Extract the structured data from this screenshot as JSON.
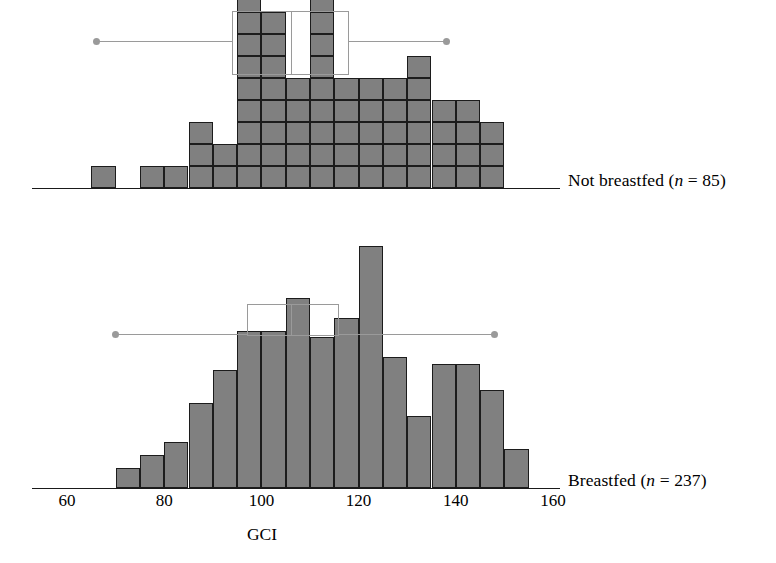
{
  "figure": {
    "axis_title": "GCI",
    "x_ticks": [
      {
        "value": 60,
        "label": "60"
      },
      {
        "value": 80,
        "label": "80"
      },
      {
        "value": 100,
        "label": "100"
      },
      {
        "value": 120,
        "label": "120"
      },
      {
        "value": 140,
        "label": "140"
      },
      {
        "value": 160,
        "label": "160"
      }
    ],
    "x_axis_range": [
      52,
      168
    ],
    "colors": {
      "bar_fill": "#808080",
      "bar_stroke": "#1c1c1c",
      "axis": "#1a1a1a",
      "boxplot": "#9a9a9a",
      "background": "#ffffff"
    }
  },
  "panels": [
    {
      "id": "not-breastfed",
      "label_text": "Not breastfed (",
      "label_n_symbol": "n",
      "label_equals": " = ",
      "label_n_value": "85)",
      "group": "Not breastfed",
      "n": 85,
      "chart_data": {
        "type": "bar",
        "title": "Not breastfed (n = 85)",
        "xlabel": "GCI",
        "ylabel": "Count",
        "bin_width": 5,
        "note": "Stacked-unit (dot) histogram; each square cell = 1 child. Tallest columns are clipped by the top edge of the image.",
        "categories": [
          67.5,
          72.5,
          77.5,
          82.5,
          87.5,
          92.5,
          97.5,
          102.5,
          107.5,
          112.5,
          117.5,
          122.5,
          127.5,
          132.5,
          137.5,
          142.5,
          147.5
        ],
        "bin_starts": [
          65,
          70,
          75,
          80,
          85,
          90,
          95,
          100,
          105,
          110,
          115,
          120,
          125,
          130,
          135,
          140,
          145
        ],
        "values": [
          1,
          0,
          1,
          1,
          3,
          2,
          9,
          8,
          5,
          9,
          5,
          5,
          5,
          6,
          4,
          4,
          3
        ],
        "xlim": [
          52,
          168
        ],
        "grid": false,
        "legend": "none"
      },
      "boxplot": {
        "min": 66,
        "q1": 94,
        "median": 106,
        "q3": 118,
        "max": 138,
        "whisker_style": "round-dot-caps"
      }
    },
    {
      "id": "breastfed",
      "label_text": "Breastfed (",
      "label_n_symbol": "n",
      "label_equals": " = ",
      "label_n_value": "237)",
      "group": "Breastfed",
      "n": 237,
      "chart_data": {
        "type": "bar",
        "title": "Breastfed (n = 237)",
        "xlabel": "GCI",
        "ylabel": "Count",
        "bin_width": 5,
        "note": "Frequency histogram, bin width 5 GCI points. Counts estimated from bar heights.",
        "categories": [
          72.5,
          77.5,
          82.5,
          87.5,
          92.5,
          97.5,
          102.5,
          107.5,
          112.5,
          117.5,
          122.5,
          127.5,
          132.5,
          137.5,
          142.5,
          147.5,
          152.5
        ],
        "bin_starts": [
          70,
          75,
          80,
          85,
          90,
          95,
          100,
          105,
          110,
          115,
          120,
          125,
          130,
          135,
          140,
          145,
          150
        ],
        "values": [
          3,
          5,
          7,
          13,
          18,
          24,
          24,
          29,
          23,
          26,
          37,
          20,
          11,
          19,
          19,
          15,
          6
        ],
        "extra_bins": {
          "157.5": 4,
          "162.5": 2
        },
        "xlim": [
          52,
          168
        ],
        "grid": false,
        "legend": "none"
      },
      "boxplot": {
        "min": 70,
        "q1": 97,
        "median": 106,
        "q3": 116,
        "max": 148,
        "whisker_style": "round-dot-caps"
      }
    }
  ]
}
